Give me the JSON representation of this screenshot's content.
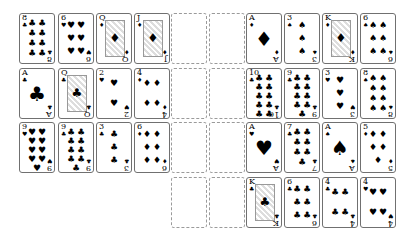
{
  "game": "Solitaire",
  "layout": {
    "card_w": 36,
    "card_h": 51,
    "rows_y": [
      13,
      68,
      122,
      177
    ],
    "left_cols_x": [
      19,
      58,
      96,
      134
    ],
    "empty_cols_x": [
      171,
      209
    ],
    "right_cols_x": [
      246,
      284,
      322,
      360
    ]
  },
  "left_grid": [
    [
      {
        "rank": "8",
        "suit": "♣"
      },
      {
        "rank": "6",
        "suit": "♥"
      },
      {
        "rank": "Q",
        "suit": "♦"
      },
      {
        "rank": "J",
        "suit": "♦"
      }
    ],
    [
      {
        "rank": "A",
        "suit": "♣"
      },
      {
        "rank": "Q",
        "suit": "♣"
      },
      {
        "rank": "2",
        "suit": "♥"
      },
      {
        "rank": "4",
        "suit": "♦"
      }
    ],
    [
      {
        "rank": "9",
        "suit": "♥"
      },
      {
        "rank": "9",
        "suit": "♣"
      },
      {
        "rank": "3",
        "suit": "♣"
      },
      {
        "rank": "6",
        "suit": "♦"
      }
    ]
  ],
  "empty_slots": {
    "columns": 2,
    "rows": 4
  },
  "right_grid": [
    [
      {
        "rank": "A",
        "suit": "♦"
      },
      {
        "rank": "3",
        "suit": "♠"
      },
      {
        "rank": "K",
        "suit": "♦"
      },
      {
        "rank": "6",
        "suit": "♠"
      }
    ],
    [
      {
        "rank": "10",
        "suit": "♣"
      },
      {
        "rank": "9",
        "suit": "♣"
      },
      {
        "rank": "3",
        "suit": "♥"
      },
      {
        "rank": "8",
        "suit": "♠"
      }
    ],
    [
      {
        "rank": "A",
        "suit": "♥"
      },
      {
        "rank": "7",
        "suit": "♣"
      },
      {
        "rank": "A",
        "suit": "♠"
      },
      {
        "rank": "5",
        "suit": "♦"
      }
    ],
    [
      {
        "rank": "K",
        "suit": "♣"
      },
      {
        "rank": "6",
        "suit": "♣"
      },
      {
        "rank": "4",
        "suit": "♣"
      },
      {
        "rank": "4",
        "suit": "♥"
      }
    ]
  ]
}
